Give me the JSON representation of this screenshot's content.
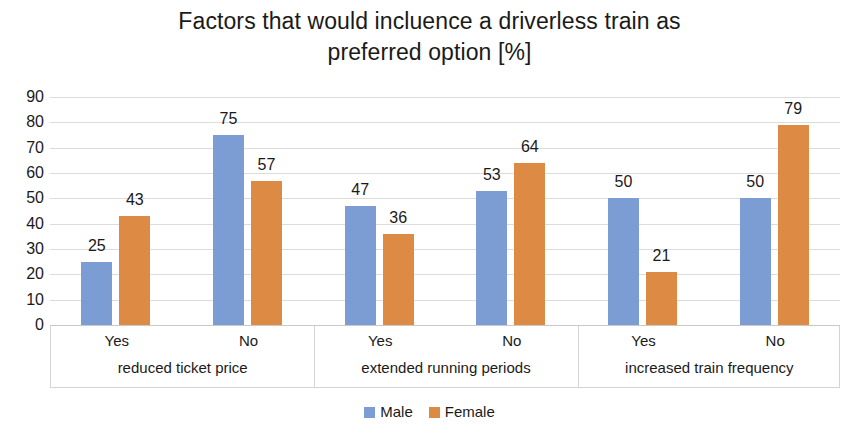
{
  "chart_data": {
    "type": "bar",
    "title": "Factors that would incluence a driverless train as preferred option [%]",
    "title_lines": [
      "Factors that would incluence a driverless train as",
      "preferred option [%]"
    ],
    "xlabel": "",
    "ylabel": "",
    "ylim": [
      0,
      90
    ],
    "ytick_labels": [
      "90",
      "80",
      "70",
      "60",
      "50",
      "40",
      "30",
      "20",
      "10",
      "0"
    ],
    "ytick_values": [
      90,
      80,
      70,
      60,
      50,
      40,
      30,
      20,
      10,
      0
    ],
    "grid": true,
    "legend_position": "bottom-center",
    "categories": [
      "Yes",
      "No",
      "Yes",
      "No",
      "Yes",
      "No"
    ],
    "group_labels": [
      "reduced ticket price",
      "extended running periods",
      "increased train frequency"
    ],
    "series": [
      {
        "name": "Male",
        "color": "#7b9dd4",
        "values": [
          25,
          75,
          47,
          53,
          50,
          50
        ]
      },
      {
        "name": "Female",
        "color": "#dd8a45",
        "values": [
          43,
          57,
          36,
          64,
          21,
          79
        ]
      }
    ],
    "groups": [
      {
        "group_label": "reduced ticket price",
        "categories": [
          {
            "label": "Yes",
            "male": 25,
            "female": 43
          },
          {
            "label": "No",
            "male": 75,
            "female": 57
          }
        ]
      },
      {
        "group_label": "extended running periods",
        "categories": [
          {
            "label": "Yes",
            "male": 47,
            "female": 36
          },
          {
            "label": "No",
            "male": 53,
            "female": 64
          }
        ]
      },
      {
        "group_label": "increased train frequency",
        "categories": [
          {
            "label": "Yes",
            "male": 50,
            "female": 21
          },
          {
            "label": "No",
            "male": 50,
            "female": 79
          }
        ]
      }
    ],
    "legend": [
      {
        "label": "Male",
        "color": "#7b9dd4"
      },
      {
        "label": "Female",
        "color": "#dd8a45"
      }
    ]
  },
  "colors": {
    "male": "#7b9dd4",
    "female": "#dd8a45",
    "gridline": "#dcdcdc",
    "axis": "#d4d4d4",
    "text": "#1a1a1a",
    "background": "#ffffff"
  }
}
